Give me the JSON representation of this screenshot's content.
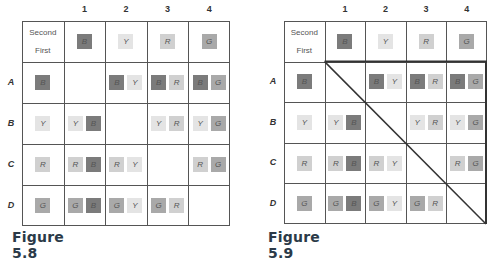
{
  "colors": {
    "B": "#7b7b7b",
    "Y": "#e4e4e4",
    "R": "#d0d0d0",
    "G": "#a9a9a9",
    "grid": "#555555",
    "caption": "#2b3a48"
  },
  "header": {
    "second_label": "Second",
    "first_label": "First"
  },
  "columns": [
    "1",
    "2",
    "3",
    "4"
  ],
  "column_tiles": [
    "B",
    "Y",
    "R",
    "G"
  ],
  "rows": [
    "A",
    "B",
    "C",
    "D"
  ],
  "row_tiles": [
    "B",
    "Y",
    "R",
    "G"
  ],
  "cells": [
    [
      [],
      [
        "B",
        "Y"
      ],
      [
        "B",
        "R"
      ],
      [
        "B",
        "G"
      ]
    ],
    [
      [
        "Y",
        "B"
      ],
      [],
      [
        "Y",
        "R"
      ],
      [
        "Y",
        "G"
      ]
    ],
    [
      [
        "R",
        "B"
      ],
      [
        "R",
        "Y"
      ],
      [],
      [
        "R",
        "G"
      ]
    ],
    [
      [
        "G",
        "B"
      ],
      [
        "G",
        "Y"
      ],
      [
        "G",
        "R"
      ],
      []
    ]
  ],
  "figures": [
    {
      "caption": "Figure 5.8",
      "diagonal": false
    },
    {
      "caption": "Figure 5.9",
      "diagonal": true
    }
  ]
}
